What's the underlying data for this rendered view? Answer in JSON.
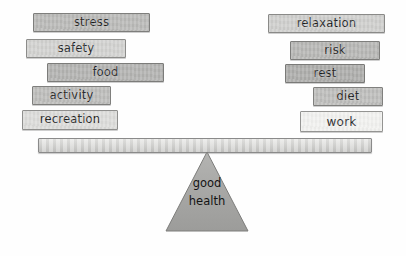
{
  "diagram": {
    "fulcrum": {
      "line1": "good",
      "line2": "health",
      "fill": "#a8a8a6",
      "stroke": "#7d7d7b"
    },
    "beam": {
      "label": "balance-beam",
      "fill": "#d8d8d6",
      "stroke": "#8a8a8a"
    },
    "left_stack": {
      "label": "left-stack",
      "blocks": [
        {
          "label": "stress",
          "fill": "#b9b9b7",
          "stroke": "#7e7e7c",
          "x": 33,
          "y": 13,
          "w": 117,
          "h": 19,
          "font": 11.5
        },
        {
          "label": "safety",
          "fill": "#d2d2d0",
          "stroke": "#8c8c8a",
          "x": 26,
          "y": 39,
          "w": 100,
          "h": 19,
          "font": 11.5
        },
        {
          "label": "food",
          "fill": "#b2b2b0",
          "stroke": "#7c7c7a",
          "x": 47,
          "y": 63,
          "w": 117,
          "h": 19,
          "font": 11.5
        },
        {
          "label": "activity",
          "fill": "#bcbcba",
          "stroke": "#7f7f7d",
          "x": 32,
          "y": 86,
          "w": 79,
          "h": 19,
          "font": 11.5
        },
        {
          "label": "recreation",
          "fill": "#dcdcda",
          "stroke": "#8f8f8d",
          "x": 22,
          "y": 110,
          "w": 96,
          "h": 20,
          "font": 11.5
        }
      ]
    },
    "right_stack": {
      "label": "right-stack",
      "blocks": [
        {
          "label": "relaxation",
          "fill": "#cfcfcd",
          "stroke": "#8a8a88",
          "x": 268,
          "y": 14,
          "w": 117,
          "h": 19,
          "font": 11.5
        },
        {
          "label": "risk",
          "fill": "#b6b6b4",
          "stroke": "#7e7e7c",
          "x": 290,
          "y": 41,
          "w": 90,
          "h": 19,
          "font": 11.5
        },
        {
          "label": "rest",
          "fill": "#acacaa",
          "stroke": "#7a7a78",
          "x": 285,
          "y": 64,
          "w": 80,
          "h": 19,
          "font": 11.5
        },
        {
          "label": "diet",
          "fill": "#bdbdbb",
          "stroke": "#80807e",
          "x": 313,
          "y": 87,
          "w": 70,
          "h": 19,
          "font": 11.5
        },
        {
          "label": "work",
          "fill": "#f2f2f0",
          "stroke": "#949492",
          "x": 300,
          "y": 111,
          "w": 83,
          "h": 21,
          "font": 12
        }
      ]
    }
  }
}
